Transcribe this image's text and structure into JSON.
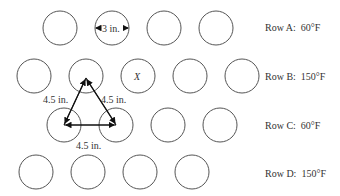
{
  "rows": [
    {
      "label": "Row A:",
      "temp": "60°F",
      "circles": [
        [
          60,
          28
        ],
        [
          112,
          28
        ],
        [
          164,
          28
        ],
        [
          216,
          28
        ]
      ]
    },
    {
      "label": "Row B:",
      "temp": "150°F",
      "circles": [
        [
          34,
          76
        ],
        [
          86,
          76
        ],
        [
          138,
          76
        ],
        [
          190,
          76
        ],
        [
          242,
          76
        ]
      ]
    },
    {
      "label": "Row C:",
      "temp": "60°F",
      "circles": [
        [
          64,
          125
        ],
        [
          116,
          125
        ],
        [
          168,
          125
        ],
        [
          220,
          125
        ]
      ]
    },
    {
      "label": "Row D:",
      "temp": "150°F",
      "circles": [
        [
          36,
          172
        ],
        [
          88,
          172
        ],
        [
          140,
          172
        ],
        [
          192,
          172
        ]
      ]
    }
  ],
  "circle_radius": 17,
  "marked_tube_label": "X",
  "diameter_label": "3 in.",
  "spacing_labels": {
    "left": "4.5 in.",
    "right": "4.5 in.",
    "bottom": "4.5 in."
  }
}
